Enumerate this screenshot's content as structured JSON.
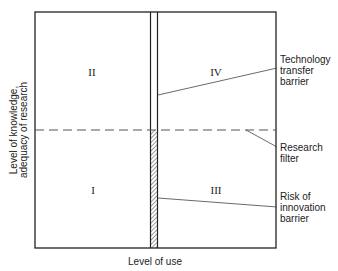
{
  "diagram": {
    "quadrants": {
      "top_left": "II",
      "top_right": "IV",
      "bottom_left": "I",
      "bottom_right": "III"
    },
    "axes": {
      "x_label": "Level of use",
      "y_label_line1": "Level of knowledge,",
      "y_label_line2": "adequacy of research"
    },
    "annotations": {
      "technology_transfer": [
        "Technology",
        "transfer",
        "barrier"
      ],
      "research_filter": [
        "Research",
        "filter"
      ],
      "risk_of_innovation": [
        "Risk of",
        "innovation",
        "barrier"
      ]
    },
    "colors": {
      "line": "#222222",
      "dash": "#555555",
      "background": "#ffffff"
    }
  }
}
